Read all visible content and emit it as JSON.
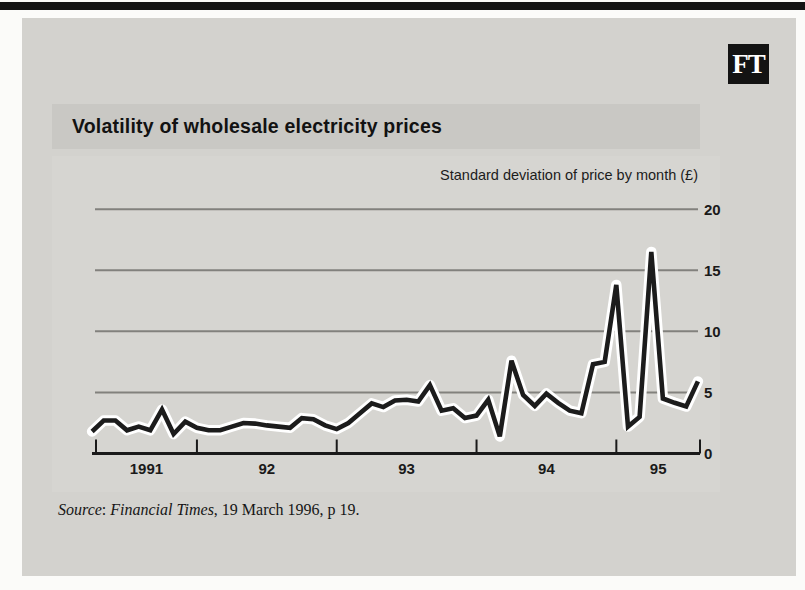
{
  "logo": {
    "text": "FT"
  },
  "header": {
    "title": "Volatility of wholesale electricity prices"
  },
  "chart_data": {
    "type": "line",
    "title": "Volatility of wholesale electricity prices",
    "ylabel": "Standard deviation of price by month (£)",
    "xlabel": "",
    "ylim": [
      0,
      20
    ],
    "y_ticks": [
      0,
      5,
      10,
      15,
      20
    ],
    "x_tick_labels": [
      "1991",
      "92",
      "93",
      "94",
      "95"
    ],
    "x_year_ticks": [
      1992,
      1993,
      1994,
      1995
    ],
    "xlim_years": [
      1991.28,
      1995.62
    ],
    "grid": "horizontal",
    "legend": "none",
    "series": [
      {
        "name": "Standard deviation of price by month (£)",
        "start": "1991-04",
        "step": "1 month",
        "values": [
          1.8,
          2.7,
          2.7,
          1.9,
          2.2,
          1.9,
          3.6,
          1.6,
          2.6,
          2.1,
          1.9,
          1.9,
          2.2,
          2.5,
          2.45,
          2.3,
          2.2,
          2.1,
          2.9,
          2.8,
          2.3,
          2.0,
          2.5,
          3.3,
          4.1,
          3.8,
          4.35,
          4.4,
          4.25,
          5.6,
          3.5,
          3.7,
          2.9,
          3.1,
          4.4,
          1.4,
          7.6,
          4.8,
          3.9,
          4.9,
          4.15,
          3.5,
          3.3,
          7.3,
          7.5,
          13.8,
          2.2,
          3.0,
          16.5,
          4.5,
          4.15,
          3.85,
          5.9
        ]
      }
    ],
    "colors": {
      "line": "#1c1c1c",
      "line_halo": "#ffffff",
      "grid": "#82817d",
      "axis": "#1a1a1a"
    }
  },
  "source": {
    "label_italic": "Source",
    "colon": ": ",
    "publication_italic": "Financial Times",
    "suffix": ", 19 March 1996, p 19."
  },
  "colors": {
    "page_bg": "#fbfbf9",
    "top_bar": "#141414",
    "card_bg": "#d3d2ce",
    "title_band_bg": "#c9c8c4",
    "logo_bg": "#131313",
    "logo_fg": "#ffffff"
  }
}
